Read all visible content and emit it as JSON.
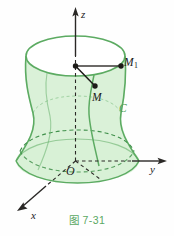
{
  "figure": {
    "caption": "图 7-31",
    "caption_color": "#5aa862",
    "background_color": "#fefefe",
    "surface_fill": "#d8f0d6",
    "surface_stroke": "#5cab62",
    "axis_color": "#2a2826",
    "point_color": "#1c1a18",
    "curve_label_color": "#4f9e58"
  },
  "axes": {
    "z": {
      "label": "z"
    },
    "y": {
      "label": "y"
    },
    "x": {
      "label": "x"
    },
    "origin": {
      "label": "O"
    }
  },
  "points": {
    "m": {
      "label": "M"
    },
    "m1": {
      "label": "M",
      "subscript": "1"
    }
  },
  "curves": {
    "c": {
      "label": "C"
    }
  }
}
